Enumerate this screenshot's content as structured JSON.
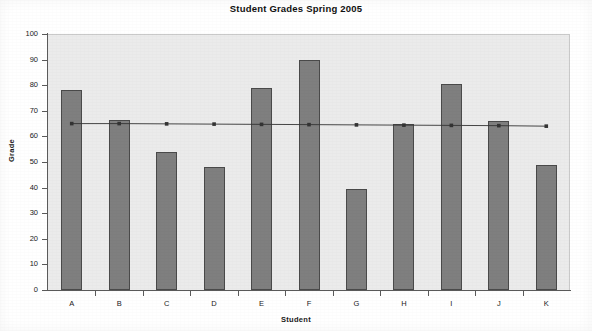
{
  "chart_data": {
    "type": "bar",
    "title": "Student Grades Spring 2005",
    "xlabel": "Student",
    "ylabel": "Grade",
    "categories": [
      "A",
      "B",
      "C",
      "D",
      "E",
      "F",
      "G",
      "H",
      "I",
      "J",
      "K"
    ],
    "values": [
      78,
      66.5,
      54,
      48,
      79,
      90,
      39.5,
      65,
      80.5,
      66,
      49
    ],
    "ylim": [
      0,
      100
    ],
    "yticks": [
      0,
      10,
      20,
      30,
      40,
      50,
      60,
      70,
      80,
      90,
      100
    ],
    "ytick_labels": [
      "0",
      "10",
      "20",
      "30",
      "40",
      "50",
      "60",
      "70",
      "80",
      "90",
      "100"
    ],
    "grid": false,
    "legend": "none",
    "series": [
      {
        "name": "Grade",
        "type": "bar",
        "values": [
          78,
          66.5,
          54,
          48,
          79,
          90,
          39.5,
          65,
          80.5,
          66,
          49
        ],
        "color": "#7f7f7f",
        "edge_color": "#4a4a4a"
      },
      {
        "name": "Average",
        "type": "line",
        "values": [
          65,
          65,
          64.9,
          64.8,
          64.7,
          64.6,
          64.5,
          64.4,
          64.3,
          64.2,
          64
        ],
        "color": "#333333",
        "marker": "square"
      }
    ],
    "colors": {
      "bar_fill": "#7f7f7f",
      "bar_edge": "#4a4a4a",
      "plot_background": "#ebebeb",
      "page_background": "#ffffff",
      "axis": "#5a5a5a",
      "line": "#333333",
      "text": "#1a1a1a"
    }
  }
}
